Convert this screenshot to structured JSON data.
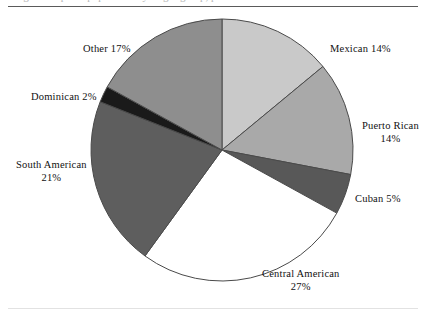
{
  "figure": {
    "title_remnant": "Figure    Hispanic population by origin group, percent distribution",
    "rule_top": "horizontal-rule",
    "rule_bottom": "horizontal-rule"
  },
  "chart_data": {
    "type": "pie",
    "title": "",
    "xlabel": "",
    "ylabel": "",
    "legend_position": "none",
    "grid": false,
    "start_angle_clock": "12 o'clock",
    "direction": "clockwise",
    "categories": [
      "Mexican",
      "Puerto Rican",
      "Cuban",
      "Central American",
      "South American",
      "Dominican",
      "Other"
    ],
    "values": [
      14,
      14,
      5,
      27,
      21,
      2,
      17
    ],
    "value_suffix": "%",
    "colors": [
      "#c9c9c9",
      "#a9a9a9",
      "#585858",
      "#ffffff",
      "#5e5e5e",
      "#1a1a1a",
      "#8e8e8e"
    ],
    "slice_border_color": "#4a4a4a",
    "labels": [
      {
        "name": "Mexican",
        "value": "14%",
        "text": "Mexican 14%",
        "layout": "inline"
      },
      {
        "name": "Puerto Rican",
        "value": "14%",
        "text": "Puerto Rican 14%",
        "layout": "stacked"
      },
      {
        "name": "Cuban",
        "value": "5%",
        "text": "Cuban 5%",
        "layout": "inline"
      },
      {
        "name": "Central American",
        "value": "27%",
        "text": "Central American 27%",
        "layout": "stacked"
      },
      {
        "name": "South American",
        "value": "21%",
        "text": "South American 21%",
        "layout": "stacked"
      },
      {
        "name": "Dominican",
        "value": "2%",
        "text": "Dominican 2%",
        "layout": "inline"
      },
      {
        "name": "Other",
        "value": "17%",
        "text": "Other 17%",
        "layout": "inline"
      }
    ]
  }
}
